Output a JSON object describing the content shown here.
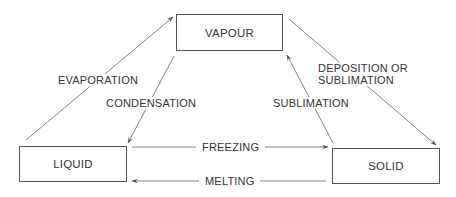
{
  "diagram": {
    "type": "phase-change-triangle",
    "states": {
      "vapour": "VAPOUR",
      "liquid": "LIQUID",
      "solid": "SOLID"
    },
    "transitions": {
      "evaporation": {
        "label": "EVAPORATION",
        "from": "LIQUID",
        "to": "VAPOUR"
      },
      "condensation": {
        "label": "CONDENSATION",
        "from": "VAPOUR",
        "to": "LIQUID"
      },
      "sublimation": {
        "label": "SUBLIMATION",
        "from": "SOLID",
        "to": "VAPOUR"
      },
      "deposition": {
        "label_line1": "DEPOSITION OR",
        "label_line2": "SUBLIMATION",
        "from": "VAPOUR",
        "to": "SOLID"
      },
      "freezing": {
        "label": "FREEZING",
        "from": "LIQUID",
        "to": "SOLID"
      },
      "melting": {
        "label": "MELTING",
        "from": "SOLID",
        "to": "LIQUID"
      }
    },
    "colors": {
      "line": "#666666",
      "box_border": "#555555",
      "text": "#333333",
      "background": "#ffffff"
    }
  }
}
